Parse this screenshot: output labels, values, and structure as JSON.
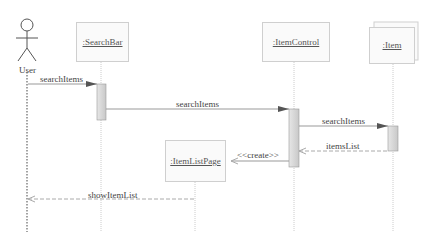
{
  "actor": {
    "name": "User"
  },
  "lifelines": [
    {
      "id": "searchbar",
      "label": ":SearchBar"
    },
    {
      "id": "itemcontrol",
      "label": ":ItemControl"
    },
    {
      "id": "item",
      "label": ":Item",
      "multi": true
    },
    {
      "id": "itemlistpage",
      "label": ":ItemListPage"
    }
  ],
  "messages": [
    {
      "from": "User",
      "to": ":SearchBar",
      "label": "searchItems",
      "type": "sync"
    },
    {
      "from": ":SearchBar",
      "to": ":ItemControl",
      "label": "searchItems",
      "type": "sync"
    },
    {
      "from": ":ItemControl",
      "to": ":Item",
      "label": "searchItems",
      "type": "sync"
    },
    {
      "from": ":Item",
      "to": ":ItemControl",
      "label": "itemsList",
      "type": "return"
    },
    {
      "from": ":ItemControl",
      "to": ":ItemListPage",
      "label": "<<create>>",
      "type": "create"
    },
    {
      "from": ":ItemListPage",
      "to": "User",
      "label": "showItemList",
      "type": "return"
    }
  ],
  "colors": {
    "line": "#9a9a9a",
    "activation": "#d8d8d8",
    "box_border": "#cfcfcf",
    "arrowhead": "#555555"
  }
}
